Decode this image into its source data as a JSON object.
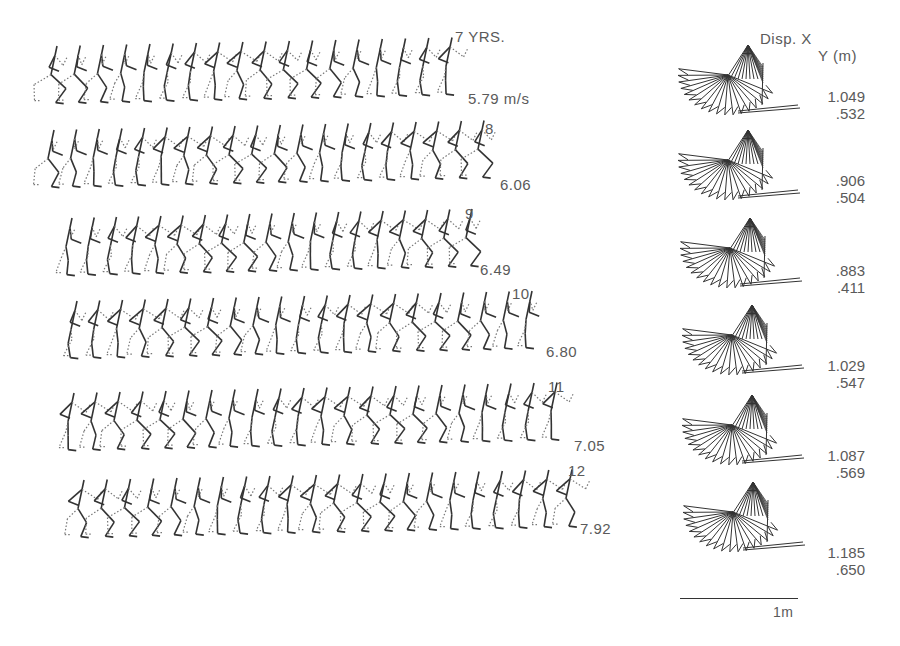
{
  "figure": {
    "rows": [
      {
        "age": "7 YRS.",
        "speed": "5.79 m/s",
        "disp_x": "1.049",
        "disp_y": ".532"
      },
      {
        "age": "8",
        "speed": "6.06",
        "disp_x": ".906",
        "disp_y": ".504"
      },
      {
        "age": "9",
        "speed": "6.49",
        "disp_x": ".883",
        "disp_y": ".411"
      },
      {
        "age": "10",
        "speed": "6.80",
        "disp_x": "1.029",
        "disp_y": ".547"
      },
      {
        "age": "11",
        "speed": "7.05",
        "disp_x": "1.087",
        "disp_y": ".569"
      },
      {
        "age": "12",
        "speed": "7.92",
        "disp_x": "1.185",
        "disp_y": ".650"
      }
    ],
    "disp_header": {
      "line1": "Disp.  X",
      "line2": "Y (m)"
    },
    "scale_label": "1m"
  },
  "layout": {
    "row_tops": [
      38,
      122,
      210,
      293,
      385,
      472
    ],
    "row_starts": [
      45,
      42,
      60,
      65,
      62,
      72
    ],
    "row_ends": [
      450,
      482,
      470,
      530,
      555,
      570
    ],
    "figures_per_row": [
      18,
      20,
      19,
      21,
      22,
      22
    ],
    "diagram_tops": [
      28,
      125,
      210,
      293,
      385,
      472
    ]
  }
}
